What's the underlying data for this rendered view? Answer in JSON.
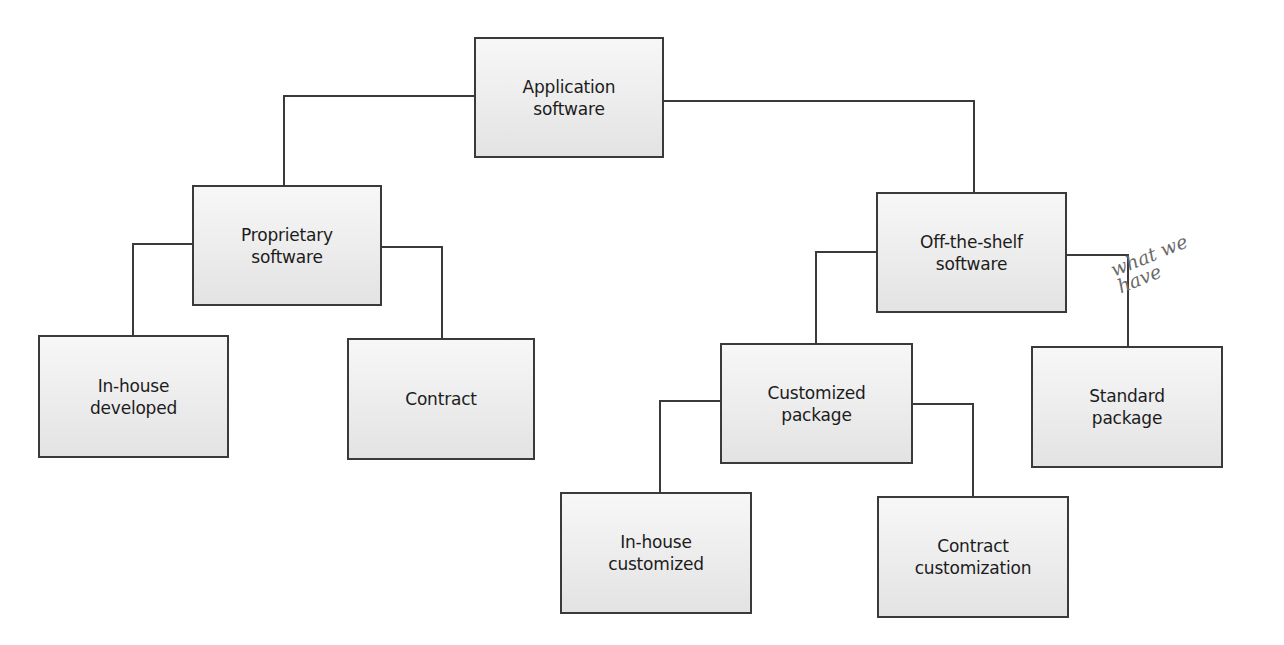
{
  "diagram": {
    "nodes": {
      "root": {
        "label": "Application\nsoftware"
      },
      "proprietary": {
        "label": "Proprietary\nsoftware"
      },
      "off_the_shelf": {
        "label": "Off-the-shelf\nsoftware"
      },
      "in_house_developed": {
        "label": "In-house\ndeveloped"
      },
      "contract": {
        "label": "Contract"
      },
      "customized_package": {
        "label": "Customized\npackage"
      },
      "standard_package": {
        "label": "Standard\npackage"
      },
      "in_house_customized": {
        "label": "In-house\ncustomized"
      },
      "contract_customization": {
        "label": "Contract\ncustomization"
      }
    },
    "edges": [
      {
        "from": "root",
        "to": "proprietary"
      },
      {
        "from": "root",
        "to": "off_the_shelf"
      },
      {
        "from": "proprietary",
        "to": "in_house_developed"
      },
      {
        "from": "proprietary",
        "to": "contract"
      },
      {
        "from": "off_the_shelf",
        "to": "customized_package"
      },
      {
        "from": "off_the_shelf",
        "to": "standard_package"
      },
      {
        "from": "customized_package",
        "to": "in_house_customized"
      },
      {
        "from": "customized_package",
        "to": "contract_customization"
      }
    ],
    "annotation": {
      "text": "what we\n   have",
      "target": "standard_package"
    },
    "colors": {
      "line": "#3a3a3a",
      "box_fill_top": "#f7f7f7",
      "box_fill_bottom": "#e3e3e3",
      "text": "#1c1c1c",
      "annotation": "#6a6a6a"
    }
  }
}
